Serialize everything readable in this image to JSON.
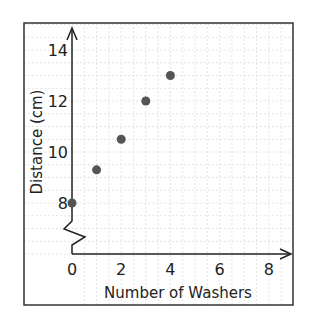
{
  "chart_data": {
    "type": "scatter",
    "title": "",
    "xlabel": "Number of Washers",
    "ylabel": "Distance (cm)",
    "x_ticks": [
      "0",
      "2",
      "4",
      "6",
      "8"
    ],
    "y_ticks": [
      "8",
      "10",
      "12",
      "14"
    ],
    "xlim": [
      0,
      8
    ],
    "ylim": [
      8,
      14
    ],
    "y_axis_break": true,
    "grid": true,
    "points": [
      {
        "x": 0,
        "y": 8
      },
      {
        "x": 1,
        "y": 9.3
      },
      {
        "x": 2,
        "y": 10.5
      },
      {
        "x": 3,
        "y": 12
      },
      {
        "x": 4,
        "y": 13
      }
    ],
    "point_color": "#555555"
  }
}
